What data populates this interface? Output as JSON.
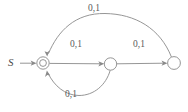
{
  "diagram": {
    "type": "finite-state-automaton",
    "start_label": "S",
    "stroke_color": "#8a8a8a",
    "label_color": "#5a5a5a",
    "background": "#ffffff",
    "states": [
      {
        "id": "q0",
        "shape": "double-circle",
        "cx": 43,
        "cy": 63,
        "r_outer": 6.2,
        "r_inner": 3.4
      },
      {
        "id": "q1",
        "shape": "circle",
        "cx": 110.5,
        "cy": 64,
        "r_outer": 6.2
      },
      {
        "id": "q2",
        "shape": "circle",
        "cx": 174,
        "cy": 63,
        "r_outer": 6.4
      }
    ],
    "transitions": [
      {
        "id": "t-start",
        "from": "start",
        "to": "q0",
        "label": "",
        "style": "straight"
      },
      {
        "id": "t-q0-q1",
        "from": "q0",
        "to": "q1",
        "label": "0,1",
        "style": "straight",
        "label_x": 70,
        "label_y": 40
      },
      {
        "id": "t-q1-q2",
        "from": "q1",
        "to": "q2",
        "label": "0,1",
        "style": "straight",
        "label_x": 133,
        "label_y": 40
      },
      {
        "id": "t-q2-q0",
        "from": "q2",
        "to": "q0",
        "label": "0,1",
        "style": "curve-top",
        "label_x": 88,
        "label_y": 4
      },
      {
        "id": "t-q1-q0",
        "from": "q1",
        "to": "q0",
        "label": "0,1",
        "style": "curve-bottom",
        "label_x": 65,
        "label_y": 90
      }
    ]
  }
}
